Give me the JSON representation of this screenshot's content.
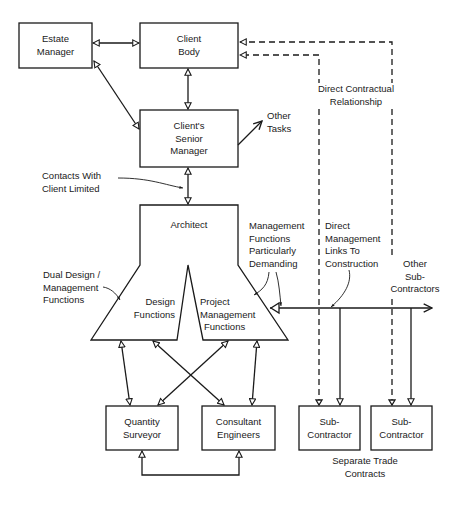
{
  "diagram": {
    "type": "organisation-structure",
    "nodes": {
      "estate_manager": {
        "line1": "Estate",
        "line2": "Manager"
      },
      "client_body": {
        "line1": "Client",
        "line2": "Body"
      },
      "senior_manager": {
        "line1": "Client's",
        "line2": "Senior",
        "line3": "Manager"
      },
      "architect": {
        "title": "Architect"
      },
      "design_functions": {
        "line1": "Design",
        "line2": "Functions"
      },
      "pm_functions": {
        "line1": "Project",
        "line2": "Management",
        "line3": "Functions"
      },
      "quantity_surveyor": {
        "line1": "Quantity",
        "line2": "Surveyor"
      },
      "consultant_engineers": {
        "line1": "Consultant",
        "line2": "Engineers"
      },
      "subcontractor_1": {
        "line1": "Sub-",
        "line2": "Contractor"
      },
      "subcontractor_2": {
        "line1": "Sub-",
        "line2": "Contractor"
      }
    },
    "annotations": {
      "other_tasks": {
        "line1": "Other",
        "line2": "Tasks"
      },
      "contacts_limited": {
        "line1": "Contacts With",
        "line2": "Client Limited"
      },
      "direct_contractual": {
        "line1": "Direct Contractual",
        "line2": "Relationship"
      },
      "dual_design": {
        "line1": "Dual Design /",
        "line2": "Management",
        "line3": "Functions"
      },
      "mgmt_demanding": {
        "line1": "Management",
        "line2": "Functions",
        "line3": "Particularly",
        "line4": "Demanding"
      },
      "direct_mgmt_links": {
        "line1": "Direct",
        "line2": "Management",
        "line3": "Links To",
        "line4": "Construction"
      },
      "other_subcontractors": {
        "line1": "Other",
        "line2": "Sub-",
        "line3": "Contractors"
      },
      "separate_trade": {
        "line1": "Separate Trade",
        "line2": "Contracts"
      }
    },
    "edges": [
      {
        "from": "Estate Manager",
        "to": "Client Body",
        "style": "solid",
        "arrows": "both"
      },
      {
        "from": "Estate Manager",
        "to": "Client's Senior Manager",
        "style": "solid",
        "arrows": "both"
      },
      {
        "from": "Client Body",
        "to": "Client's Senior Manager",
        "style": "solid",
        "arrows": "both"
      },
      {
        "from": "Client's Senior Manager",
        "to": "Other Tasks",
        "style": "solid",
        "arrows": "end"
      },
      {
        "from": "Client's Senior Manager",
        "to": "Architect",
        "style": "solid",
        "arrows": "both"
      },
      {
        "from": "Client Body",
        "to": "Sub-Contractor (1)",
        "style": "dashed",
        "arrows": "both"
      },
      {
        "from": "Client Body",
        "to": "Sub-Contractor (2)",
        "style": "dashed",
        "arrows": "both"
      },
      {
        "from": "Project Management Functions",
        "to": "Other Sub-Contractors",
        "style": "solid",
        "arrows": "end"
      },
      {
        "from": "Project Management Functions",
        "to": "Sub-Contractor (1)",
        "style": "solid",
        "arrows": "end"
      },
      {
        "from": "Project Management Functions",
        "to": "Sub-Contractor (2)",
        "style": "solid",
        "arrows": "end"
      },
      {
        "from": "Design Functions",
        "to": "Quantity Surveyor",
        "style": "solid",
        "arrows": "both"
      },
      {
        "from": "Design Functions",
        "to": "Consultant Engineers",
        "style": "solid",
        "arrows": "both"
      },
      {
        "from": "Project Management Functions",
        "to": "Quantity Surveyor",
        "style": "solid",
        "arrows": "both"
      },
      {
        "from": "Project Management Functions",
        "to": "Consultant Engineers",
        "style": "solid",
        "arrows": "both"
      },
      {
        "from": "Quantity Surveyor",
        "to": "Consultant Engineers",
        "style": "solid",
        "arrows": "both"
      }
    ]
  }
}
